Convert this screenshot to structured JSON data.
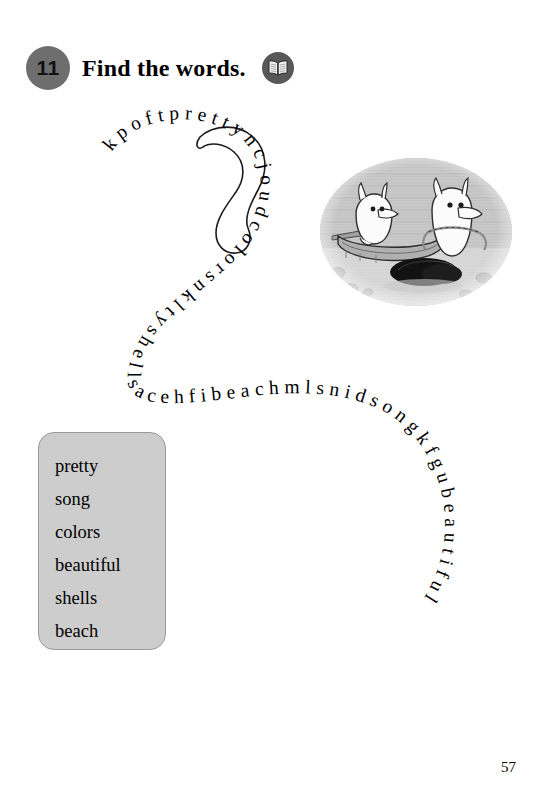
{
  "page": {
    "number": "57"
  },
  "exercise": {
    "number": "11",
    "title": "Find the words.",
    "book_icon_name": "open-book-icon"
  },
  "puzzle": {
    "type": "word-snake",
    "letter_string": "kpoftprettyncjoudcolorsnkltyshellsacehfibeachmlsnidsongkfgubeautiful",
    "segments": [
      {
        "letters": "kpoft",
        "circled": false
      },
      {
        "letters": "pretty",
        "circled": true
      },
      {
        "letters": "ncjoud",
        "circled": false
      },
      {
        "letters": "colors",
        "circled": false
      },
      {
        "letters": "nklty",
        "circled": false
      },
      {
        "letters": "shells",
        "circled": false
      },
      {
        "letters": "acehfi",
        "circled": false
      },
      {
        "letters": "beach",
        "circled": false
      },
      {
        "letters": "mlsnid",
        "circled": false
      },
      {
        "letters": "song",
        "circled": false
      },
      {
        "letters": "kfgu",
        "circled": false
      },
      {
        "letters": "beautiful",
        "circled": false
      }
    ],
    "circled_answer": "pretty"
  },
  "word_list": {
    "items": [
      "pretty",
      "song",
      "colors",
      "beautiful",
      "shells",
      "beach"
    ]
  },
  "illustration": {
    "alt": "Two Moomin characters with a rowboat on a pebbly shore",
    "style": "grayscale halftone photo-vignette"
  },
  "colors": {
    "badge": "#6e6e6e",
    "book_icon": "#585858",
    "word_box_fill": "#cdcdcd",
    "word_box_border": "#9a9a9a",
    "ink": "#000000",
    "page_background": "#ffffff"
  }
}
